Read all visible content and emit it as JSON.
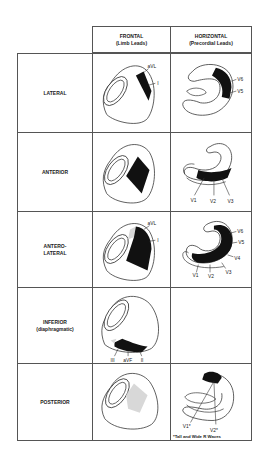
{
  "columns": {
    "frontal": {
      "title": "FRONTAL",
      "subtitle": "(Limb Leads)"
    },
    "horizontal": {
      "title": "HORIZONTAL",
      "subtitle": "(Precordial Leads)"
    }
  },
  "rows": [
    {
      "label": "LATERAL",
      "sublabel": "",
      "frontal_leads": [
        "aVL",
        "I"
      ],
      "horizontal_leads": [
        "V6",
        "V5"
      ]
    },
    {
      "label": "ANTERIOR",
      "sublabel": "",
      "frontal_leads": [],
      "horizontal_leads": [
        "V1",
        "V2",
        "V3"
      ]
    },
    {
      "label": "ANTERO-",
      "sublabel": "LATERAL",
      "frontal_leads": [
        "aVL",
        "I"
      ],
      "horizontal_leads": [
        "V6",
        "V5",
        "V4",
        "V3",
        "V2",
        "V1"
      ]
    },
    {
      "label": "INFERIOR",
      "sublabel": "(diaphragmatic)",
      "frontal_leads": [
        "III",
        "aVF",
        "II"
      ],
      "horizontal_leads": []
    },
    {
      "label": "POSTERIOR",
      "sublabel": "",
      "frontal_leads": [],
      "horizontal_leads": [
        "V1*",
        "V2*"
      ],
      "footnote": "*Tall and Wide R Waves"
    }
  ],
  "colors": {
    "infarct": "#111111",
    "shaded": "#d8d8d8",
    "outline": "#333333",
    "grid": "#555555"
  }
}
